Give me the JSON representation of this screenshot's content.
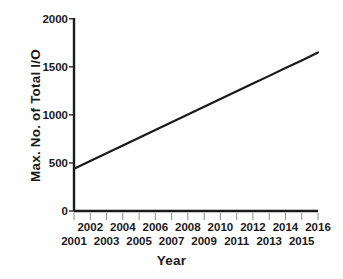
{
  "chart_data": {
    "type": "line",
    "title": "",
    "xlabel": "Year",
    "ylabel": "Max. No. of Total I/O",
    "xlim": [
      2001,
      2016
    ],
    "ylim": [
      0,
      2000
    ],
    "grid": false,
    "legend": "none",
    "x_tick_labels": [
      "2001",
      "2002",
      "2003",
      "2004",
      "2005",
      "2006",
      "2007",
      "2008",
      "2009",
      "2010",
      "2011",
      "2012",
      "2013",
      "2014",
      "2015",
      "2016"
    ],
    "x_tick_labels_top_row": [
      "2002",
      "2004",
      "2006",
      "2008",
      "2010",
      "2012",
      "2014",
      "2016"
    ],
    "x_tick_labels_bottom_row": [
      "2001",
      "2003",
      "2005",
      "2007",
      "2009",
      "2011",
      "2013",
      "2015"
    ],
    "y_tick_labels": [
      "2000",
      "1500",
      "1000",
      "500",
      "0"
    ],
    "y_ticks": [
      2000,
      1500,
      1000,
      500,
      0
    ],
    "series": [
      {
        "name": "Max. No. of Total I/O",
        "color": "#1a1a1a",
        "x": [
          2001,
          2002,
          2003,
          2004,
          2005,
          2006,
          2007,
          2008,
          2009,
          2010,
          2011,
          2012,
          2013,
          2014,
          2015,
          2016
        ],
        "values": [
          440,
          521,
          601,
          682,
          762,
          843,
          923,
          1004,
          1084,
          1165,
          1245,
          1326,
          1406,
          1487,
          1567,
          1650
        ]
      }
    ]
  },
  "axes": {
    "axis_color": "#1a1a1a",
    "background": "#fefefe"
  }
}
